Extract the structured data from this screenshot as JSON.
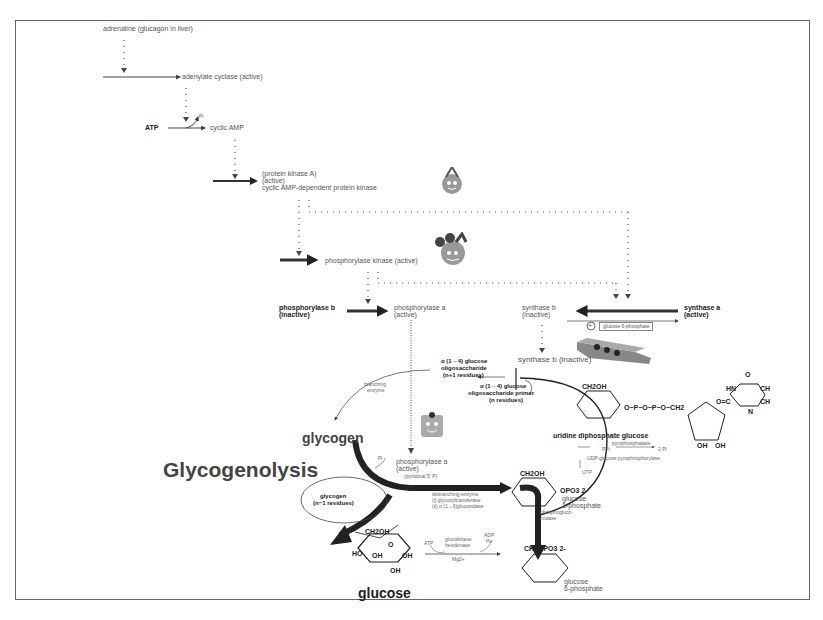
{
  "diagram": {
    "title": "Glycogenolysis",
    "signaling_cascade": {
      "hormone": "adrenaline (glucagon in liver)",
      "enzyme1": "adenylate cyclase (active)",
      "substrate": "ATP",
      "product": "cyclic AMP",
      "pi_label": "Pi",
      "pka_line1": "(protein kinase A)",
      "pka_line2": "(active)",
      "pka_line3": "cyclic AMP-dependent protein kinase",
      "phosphorylase_kinase": "phosphorylase kinase (active)"
    },
    "phosphorylase": {
      "b_line1": "phosphorylase b",
      "b_line2": "(inactive)",
      "a_line1": "phosphorylase a",
      "a_line2": "(active)",
      "a2_line1": "phosphorylase a",
      "a2_line2": "(active)",
      "cofactor": "(pyridoxal 5' P)"
    },
    "synthase": {
      "b_line1": "synthase b",
      "b_line2": "(inactive)",
      "a_line1": "synthase a",
      "a_line2": "(active)",
      "activator_symbol": "+",
      "activator": "glucose 6-phosphate",
      "b_inactive": "synthase b (inactive)"
    },
    "oligosaccharides": {
      "n1_line1": "α (1→4) glucose",
      "n1_line2": "oligosaccharide",
      "n1_line3": "(n+1 residues)",
      "primer_line1": "α (1→4) glucose",
      "primer_line2": "oligosaccharide primer",
      "primer_line3": "(n residues)"
    },
    "branching_line1": "branching",
    "branching_line2": "enzyme",
    "glycogen": "glycogen",
    "glycogen_n1_line1": "glycogen",
    "glycogen_n1_line2": "(n−1 residues)",
    "pi_small": "Pi",
    "debranching_line1": "debranching enzyme",
    "debranching_line2": "(i) glycosyltransferase",
    "debranching_line3": "(ii) α (1→6)glucosidase",
    "udp_glucose": "uridine diphosphate glucose",
    "ppi": "PPi",
    "pyrophosphatase": "pyrophosphatase",
    "two_pi": "2 Pi",
    "udp_pyrophosphorylase": "UDP-glucose pyrophosphorylase",
    "utp": "UTP",
    "g1p_line1": "glucose",
    "g1p_line2": "1-phosphate",
    "phosphoglucomutase_line1": "phosphogluco-",
    "phosphoglucomutase_line2": "mutase",
    "glucose": "glucose",
    "hexokinase": {
      "atp": "ATP",
      "line1": "glucokinase",
      "line2": "hexokinase",
      "mg": "Mg2+",
      "adp": "ADP",
      "h": "H+"
    },
    "g6p_line1": "glucose",
    "g6p_line2": "6-phosphate",
    "glucose_ring": {
      "ch2oh": "CH2OH",
      "o": "O",
      "h": "H",
      "oh": "OH",
      "ho": "HO"
    },
    "g1p_ring": {
      "sub": "OPO3 2-"
    },
    "g6p_ring": {
      "ch2": "CH2OPO3 2-"
    },
    "udp_ring": {
      "phosphate": "O−P−O−P−O−CH2",
      "o_minus": "O−",
      "o_dbl": "O",
      "uracil_o": "O",
      "uracil_c": "C",
      "hn": "HN",
      "ch": "CH",
      "oc": "O=C",
      "n": "N"
    },
    "icons": {
      "pka_mascot": "protein-kinase-a-mascot",
      "phk_mascot": "phosphorylase-kinase-mascot",
      "phos_mascot": "phosphorylase-a-mascot",
      "synthase_mascot": "glycogen-synthase-block"
    },
    "colors": {
      "text": "#555555",
      "dark_text": "#222222",
      "arrow": "#333333",
      "mascot": "#999999",
      "frame": "#666666"
    }
  }
}
